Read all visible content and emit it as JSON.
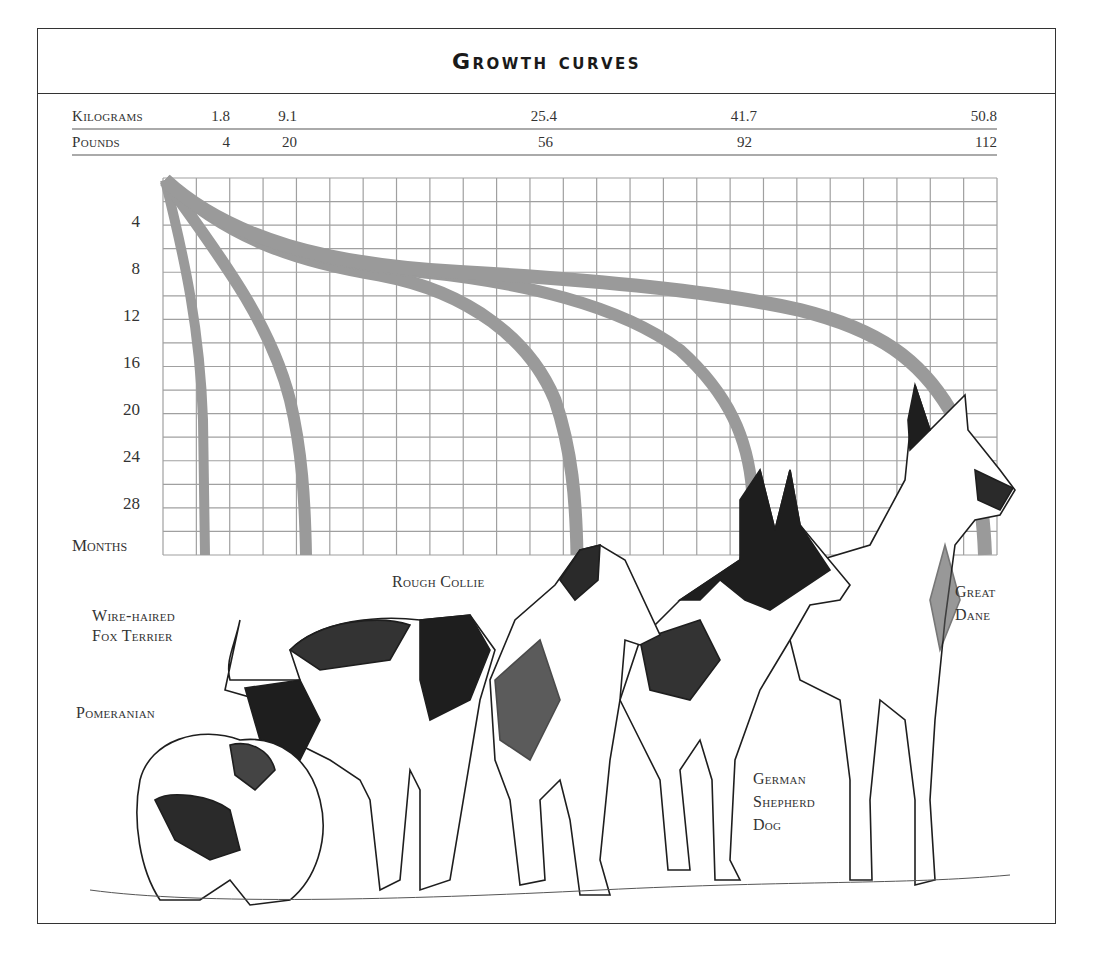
{
  "header": {
    "title": "Growth curves"
  },
  "scale": {
    "kilograms": {
      "label": "Kilograms",
      "values": [
        "1.8",
        "9.1",
        "25.4",
        "41.7",
        "50.8"
      ]
    },
    "pounds": {
      "label": "Pounds",
      "values": [
        "4",
        "20",
        "56",
        "92",
        "112"
      ]
    }
  },
  "axis": {
    "y_label": "Months",
    "y_ticks": [
      "4",
      "8",
      "12",
      "16",
      "20",
      "24",
      "28"
    ]
  },
  "breeds": [
    {
      "name": "Pomeranian",
      "lines": [
        "Pomeranian"
      ]
    },
    {
      "name": "Wire-haired Fox Terrier",
      "lines": [
        "Wire-haired",
        "Fox Terrier"
      ]
    },
    {
      "name": "Rough Collie",
      "lines": [
        "Rough Collie"
      ]
    },
    {
      "name": "German Shepherd Dog",
      "lines": [
        "German",
        "Shepherd",
        "Dog"
      ]
    },
    {
      "name": "Great Dane",
      "lines": [
        "Great",
        "Dane"
      ]
    }
  ],
  "colors": {
    "curve": "#9a9a9a",
    "grid": "#9c9c9c",
    "frame": "#333333",
    "ink": "#1e1e1e"
  },
  "chart_data": {
    "type": "line",
    "title": "Growth curves",
    "xlabel": "Adult weight (Kilograms / Pounds)",
    "ylabel": "Months",
    "x_ticks_kg": [
      1.8,
      9.1,
      25.4,
      41.7,
      50.8
    ],
    "x_ticks_lb": [
      4,
      20,
      56,
      92,
      112
    ],
    "y_ticks": [
      4,
      8,
      12,
      16,
      20,
      24,
      28
    ],
    "ylim": [
      0,
      32
    ],
    "y_inverted": true,
    "grid": true,
    "series": [
      {
        "name": "Pomeranian",
        "adult_weight_kg": 1.8,
        "adult_weight_lb": 4,
        "points_months_kg": [
          [
            0,
            0
          ],
          [
            4,
            0.6
          ],
          [
            8,
            1.0
          ],
          [
            12,
            1.3
          ],
          [
            16,
            1.5
          ],
          [
            20,
            1.65
          ],
          [
            24,
            1.75
          ],
          [
            28,
            1.8
          ],
          [
            32,
            1.8
          ]
        ]
      },
      {
        "name": "Wire-haired Fox Terrier",
        "adult_weight_kg": 9.1,
        "adult_weight_lb": 20,
        "points_months_kg": [
          [
            0,
            0
          ],
          [
            4,
            2.0
          ],
          [
            8,
            4.2
          ],
          [
            12,
            6.0
          ],
          [
            16,
            7.4
          ],
          [
            20,
            8.4
          ],
          [
            24,
            8.9
          ],
          [
            28,
            9.1
          ],
          [
            32,
            9.1
          ]
        ]
      },
      {
        "name": "Rough Collie",
        "adult_weight_kg": 25.4,
        "adult_weight_lb": 56,
        "points_months_kg": [
          [
            0,
            0
          ],
          [
            4,
            6.5
          ],
          [
            8,
            13.0
          ],
          [
            12,
            18.0
          ],
          [
            16,
            21.5
          ],
          [
            20,
            23.6
          ],
          [
            24,
            24.8
          ],
          [
            28,
            25.3
          ],
          [
            32,
            25.4
          ]
        ]
      },
      {
        "name": "German Shepherd Dog",
        "adult_weight_kg": 41.7,
        "adult_weight_lb": 92,
        "points_months_kg": [
          [
            0,
            0
          ],
          [
            4,
            6.8
          ],
          [
            8,
            16.0
          ],
          [
            12,
            27.0
          ],
          [
            16,
            34.0
          ],
          [
            20,
            38.5
          ],
          [
            24,
            40.6
          ],
          [
            28,
            41.5
          ],
          [
            32,
            41.7
          ]
        ]
      },
      {
        "name": "Great Dane",
        "adult_weight_kg": 50.8,
        "adult_weight_lb": 112,
        "points_months_kg": [
          [
            0,
            0
          ],
          [
            4,
            6.8
          ],
          [
            8,
            16.0
          ],
          [
            12,
            35.0
          ],
          [
            16,
            44.0
          ],
          [
            20,
            48.0
          ],
          [
            24,
            50.0
          ],
          [
            28,
            50.6
          ],
          [
            32,
            50.8
          ]
        ]
      }
    ]
  }
}
